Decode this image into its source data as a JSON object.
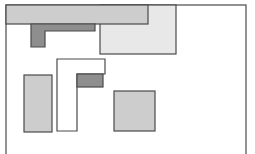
{
  "diagram": {
    "width": 255,
    "height": 154,
    "colors": {
      "background": "#ffffff",
      "stroke": "#4a4a4a",
      "light": "#e8e8e8",
      "medium": "#cdcdcd",
      "dark": "#8e8e8e",
      "white": "#ffffff"
    },
    "container": {
      "x": 6,
      "y": 5,
      "w": 240,
      "h": 160
    },
    "shapes": [
      {
        "id": "light-rect",
        "type": "rect",
        "fill": "light",
        "x": 100,
        "y": 5,
        "w": 76,
        "h": 49
      },
      {
        "id": "top-bar",
        "type": "rect",
        "fill": "medium",
        "x": 6,
        "y": 5,
        "w": 142,
        "h": 19
      },
      {
        "id": "dark-l",
        "type": "poly",
        "fill": "dark",
        "points": "31,24 95,24 95,31 45,31 45,47 31,47"
      },
      {
        "id": "white-l",
        "type": "poly",
        "fill": "white",
        "points": "57,59 105,59 105,74 77,74 77,131 57,131"
      },
      {
        "id": "dark-small",
        "type": "rect",
        "fill": "dark",
        "x": 77,
        "y": 74,
        "w": 26,
        "h": 13
      },
      {
        "id": "left-rect",
        "type": "rect",
        "fill": "medium",
        "x": 24,
        "y": 75,
        "w": 28,
        "h": 57
      },
      {
        "id": "square",
        "type": "rect",
        "fill": "medium",
        "x": 114,
        "y": 91,
        "w": 41,
        "h": 40
      }
    ]
  }
}
